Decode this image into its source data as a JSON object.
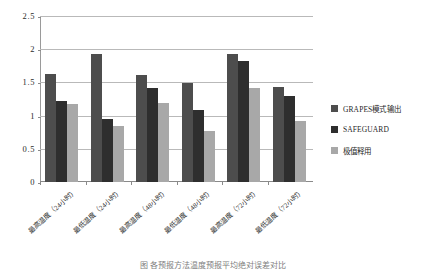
{
  "chart_data": {
    "type": "bar",
    "title": "",
    "xlabel": "",
    "ylabel": "",
    "ylim": [
      0,
      2.5
    ],
    "grid": true,
    "legend_position": "right",
    "y_ticks": [
      "0",
      "0.5",
      "1",
      "1.5",
      "2",
      "2.5"
    ],
    "y_tick_values": [
      0,
      0.5,
      1,
      1.5,
      2,
      2.5
    ],
    "categories": [
      "最高温度（24小时）",
      "最低温度（24小时）",
      "最高温度（48小时）",
      "最低温度（48小时）",
      "最高温度（72小时）",
      "最低温度（72小时）"
    ],
    "series": [
      {
        "name": "GRAPES模式输出",
        "color": "#4d4d4d",
        "values": [
          1.63,
          1.93,
          1.61,
          1.49,
          1.93,
          1.43
        ]
      },
      {
        "name": "SAFEGUARD",
        "color": "#2e2e2e",
        "values": [
          1.22,
          0.95,
          1.42,
          1.08,
          1.82,
          1.3
        ]
      },
      {
        "name": "极值释用",
        "color": "#a8a8a8",
        "values": [
          1.17,
          0.85,
          1.19,
          0.77,
          1.41,
          0.92
        ]
      }
    ]
  },
  "legend": {
    "items": [
      {
        "label": "GRAPES模式输出",
        "color": "#4d4d4d"
      },
      {
        "label": "SAFEGUARD",
        "color": "#2e2e2e"
      },
      {
        "label": "极值释用",
        "color": "#a8a8a8"
      }
    ]
  },
  "caption": {
    "text": "图     各预报方法温度预报平均绝对误差对比"
  }
}
